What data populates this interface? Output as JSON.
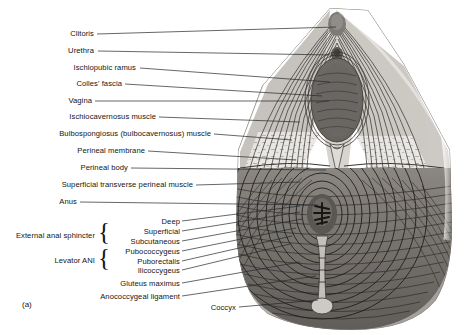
{
  "figure": {
    "caption": "(a)",
    "type": "anatomical-illustration",
    "style": "grayscale halftone line drawing",
    "background_color": "#ffffff",
    "ink_color": "#141414"
  },
  "labels": {
    "left_column": [
      {
        "id": "clitoris",
        "text": "Clitoris"
      },
      {
        "id": "urethra",
        "text": "Urethra"
      },
      {
        "id": "ischiopubic-ramus",
        "text": "Ischiopubic ramus"
      },
      {
        "id": "colles-fascia",
        "text": "Colles' fascia"
      },
      {
        "id": "vagina",
        "text": "Vagina"
      },
      {
        "id": "ischiocavernosus-muscle",
        "text": "Ischiocavernosus muscle"
      },
      {
        "id": "bulbospongiosus-muscle",
        "text": "Bulbospongiosus (bulbocavernosus) muscle"
      },
      {
        "id": "perineal-membrane",
        "text": "Perineal membrane"
      },
      {
        "id": "perineal-body",
        "text": "Perineal body"
      },
      {
        "id": "superficial-transverse-perineal-muscle",
        "text": "Superficial transverse perineal muscle"
      },
      {
        "id": "anus",
        "text": "Anus"
      }
    ],
    "groups": [
      {
        "id": "external-anal-sphincter",
        "text": "External anal sphincter"
      },
      {
        "id": "levator-ani",
        "text": "Levator ANI"
      }
    ],
    "sub_labels": [
      {
        "id": "deep",
        "text": "Deep",
        "group": "external-anal-sphincter"
      },
      {
        "id": "superficial",
        "text": "Superficial",
        "group": "external-anal-sphincter"
      },
      {
        "id": "subcutaneous",
        "text": "Subcutaneous",
        "group": "external-anal-sphincter"
      },
      {
        "id": "pubococcygeus",
        "text": "Pubococcygeus",
        "group": "levator-ani"
      },
      {
        "id": "puborectalis",
        "text": "Puborectalis",
        "group": "levator-ani"
      },
      {
        "id": "ilicoccygeus",
        "text": "Ilicoccygeus",
        "group": "levator-ani"
      },
      {
        "id": "gluteus-maximus",
        "text": "Gluteus maximus",
        "group": ""
      },
      {
        "id": "anococcygeal-ligament",
        "text": "Anococcygeal ligament",
        "group": ""
      }
    ],
    "bottom": [
      {
        "id": "coccyx",
        "text": "Coccyx"
      }
    ]
  }
}
